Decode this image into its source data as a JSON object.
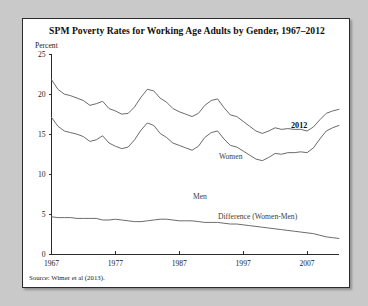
{
  "figure": {
    "title": "SPM Poverty Rates for Working Age Adults by Gender, 1967–2012",
    "y_unit_label": "Percent",
    "source": "Source: Wimer et al (2013)."
  },
  "annotations": {
    "women_label": "Women",
    "men_label": "Men",
    "difference_label": "Difference (Women-Men)",
    "end_year_label": "2012"
  },
  "chart_data": {
    "type": "line",
    "title": "SPM Poverty Rates for Working Age Adults by Gender, 1967–2012",
    "xlabel": "",
    "ylabel": "Percent",
    "xlim": [
      1967,
      2012
    ],
    "ylim": [
      0,
      25
    ],
    "yticks": [
      0,
      5,
      10,
      15,
      20,
      25
    ],
    "xticks": [
      1967,
      1977,
      1987,
      1997,
      2007
    ],
    "grid": false,
    "legend": "inline-annotations",
    "x": [
      1967,
      1968,
      1969,
      1970,
      1971,
      1972,
      1973,
      1974,
      1975,
      1976,
      1977,
      1978,
      1979,
      1980,
      1981,
      1982,
      1983,
      1984,
      1985,
      1986,
      1987,
      1988,
      1989,
      1990,
      1991,
      1992,
      1993,
      1994,
      1995,
      1996,
      1997,
      1998,
      1999,
      2000,
      2001,
      2002,
      2003,
      2004,
      2005,
      2006,
      2007,
      2008,
      2009,
      2010,
      2011,
      2012
    ],
    "series": [
      {
        "name": "Women",
        "values": [
          21.8,
          20.6,
          20.0,
          19.8,
          19.5,
          19.2,
          18.6,
          18.8,
          19.1,
          18.2,
          17.9,
          17.5,
          17.6,
          18.4,
          19.6,
          20.6,
          20.4,
          19.5,
          19.0,
          18.2,
          17.8,
          17.5,
          17.2,
          17.6,
          18.6,
          19.2,
          19.4,
          18.3,
          17.4,
          17.2,
          16.6,
          16.0,
          15.4,
          15.1,
          15.4,
          15.8,
          15.6,
          15.7,
          15.6,
          15.6,
          15.4,
          15.9,
          16.8,
          17.6,
          17.9,
          18.1
        ]
      },
      {
        "name": "Men",
        "values": [
          17.1,
          16.0,
          15.4,
          15.2,
          15.0,
          14.7,
          14.1,
          14.3,
          14.8,
          13.9,
          13.5,
          13.2,
          13.4,
          14.3,
          15.5,
          16.4,
          16.1,
          15.1,
          14.6,
          13.9,
          13.6,
          13.3,
          13.0,
          13.5,
          14.6,
          15.2,
          15.4,
          14.4,
          13.6,
          13.4,
          12.9,
          12.4,
          11.9,
          11.7,
          12.1,
          12.6,
          12.5,
          12.7,
          12.7,
          12.8,
          12.7,
          13.3,
          14.4,
          15.4,
          15.8,
          16.1
        ]
      },
      {
        "name": "Difference (Women-Men)",
        "values": [
          4.7,
          4.6,
          4.6,
          4.6,
          4.5,
          4.5,
          4.5,
          4.5,
          4.3,
          4.3,
          4.4,
          4.3,
          4.2,
          4.1,
          4.1,
          4.2,
          4.3,
          4.4,
          4.4,
          4.3,
          4.2,
          4.2,
          4.2,
          4.1,
          4.0,
          4.0,
          4.0,
          3.9,
          3.8,
          3.8,
          3.7,
          3.6,
          3.5,
          3.4,
          3.3,
          3.2,
          3.1,
          3.0,
          2.9,
          2.8,
          2.7,
          2.6,
          2.4,
          2.2,
          2.1,
          2.0
        ]
      }
    ]
  }
}
